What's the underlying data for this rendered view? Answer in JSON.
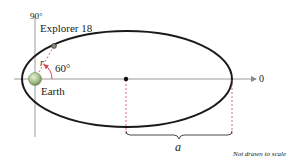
{
  "diagram": {
    "labels": {
      "angle_90": "90°",
      "satellite": "Explorer 18",
      "radius": "r",
      "angle_60": "60°",
      "planet": "Earth",
      "angle_0": "0",
      "semi_major_axis": "a",
      "note": "Not drawn to scale"
    },
    "colors": {
      "orbit": "#1a1a1a",
      "axes": "#9a9a9a",
      "dashed_guides": "#d9404a",
      "angle_arc": "#d9404a",
      "earth_fill": "#a9c38f",
      "earth_stroke": "#6f8a5a",
      "satellite_fill": "#8a8f7a"
    }
  }
}
